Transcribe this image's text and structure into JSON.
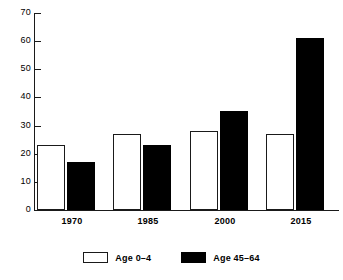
{
  "chart_data": {
    "type": "bar",
    "title": "",
    "xlabel": "",
    "ylabel": "",
    "categories": [
      "1970",
      "1985",
      "2000",
      "2015"
    ],
    "series": [
      {
        "name": "Age 0–4",
        "values": [
          23,
          27,
          28,
          27
        ],
        "color": "#ffffff"
      },
      {
        "name": "Age 45–64",
        "values": [
          17,
          23,
          35,
          61
        ],
        "color": "#000000"
      }
    ],
    "ylim": [
      0,
      70
    ],
    "yticks": [
      0,
      10,
      20,
      30,
      40,
      50,
      60,
      70
    ],
    "ytick_labels": [
      "0",
      "10",
      "20",
      "30",
      "40",
      "50",
      "60",
      "70"
    ],
    "grid": false,
    "legend_position": "bottom"
  },
  "legend": {
    "items": [
      {
        "label": "Age 0–4",
        "swatch": "white-outline-swatch"
      },
      {
        "label": "Age 45–64",
        "swatch": "black-filled-swatch"
      }
    ]
  },
  "colors": {
    "axis": "#1a1a1a",
    "series_light": "#ffffff",
    "series_dark": "#000000",
    "background": "#ffffff"
  }
}
